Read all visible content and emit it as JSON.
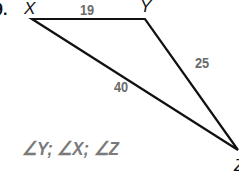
{
  "problem": {
    "number_label": "9."
  },
  "triangle": {
    "vertices": {
      "X": {
        "label": "X",
        "x": 32,
        "y": 19
      },
      "Y": {
        "label": "Y",
        "x": 145,
        "y": 19
      },
      "Z": {
        "label": "Z",
        "x": 238,
        "y": 150
      }
    },
    "sides": {
      "XY": "19",
      "YZ": "25",
      "XZ": "40"
    },
    "line_color": "#111111"
  },
  "answer": {
    "text": "∠Y; ∠X; ∠Z",
    "color": "#7a7a7a"
  }
}
